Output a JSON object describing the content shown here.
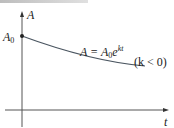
{
  "figure": {
    "y_axis_label": "A",
    "x_axis_label": "t",
    "initial_value_label": "A",
    "initial_value_subscript": "0",
    "equation": {
      "lhs": "A = A",
      "subscript": "0",
      "base": "e",
      "exponent": "kt"
    },
    "condition": "(k < 0)"
  },
  "colors": {
    "axis": "#555555",
    "curve": "#4a5560",
    "text": "#222222",
    "top_band": "#c8c8c8"
  }
}
